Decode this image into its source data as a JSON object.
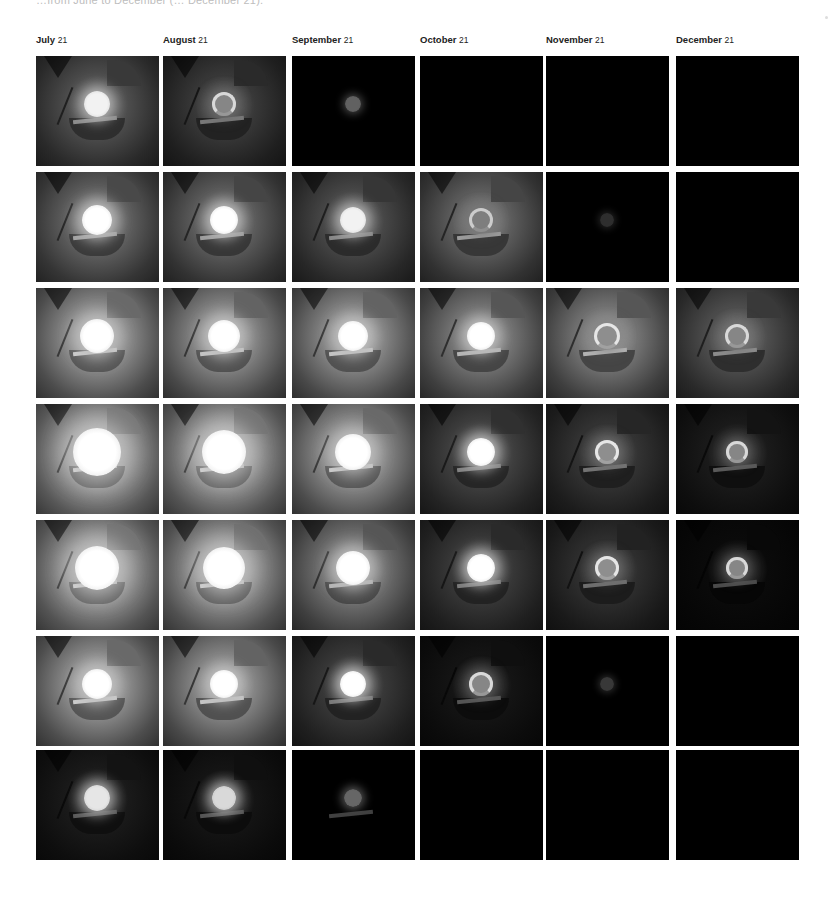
{
  "caption": "…from June to December (… December 21).",
  "columns": [
    {
      "month": "July",
      "day": "21"
    },
    {
      "month": "August",
      "day": "21"
    },
    {
      "month": "September",
      "day": "21"
    },
    {
      "month": "October",
      "day": "21"
    },
    {
      "month": "November",
      "day": "21"
    },
    {
      "month": "December",
      "day": "21"
    }
  ],
  "layout": {
    "col_x": [
      0,
      127,
      256,
      384,
      510,
      640
    ],
    "row_y": [
      0,
      116,
      232,
      348,
      464,
      580,
      694
    ],
    "cell_w": 123,
    "cell_h": 110
  },
  "rows": [
    {
      "cells": [
        {
          "bg": 0.3,
          "light": 0.95,
          "size": 26,
          "structure": 0.45,
          "ring": false
        },
        {
          "bg": 0.22,
          "light": 0.85,
          "size": 24,
          "structure": 0.4,
          "ring": true
        },
        {
          "bg": 0.0,
          "light": 0.38,
          "size": 16,
          "structure": 0.0,
          "ring": false
        },
        {
          "bg": 0.0,
          "light": 0.0,
          "size": 0,
          "structure": 0.0,
          "ring": false
        },
        {
          "bg": 0.0,
          "light": 0.0,
          "size": 0,
          "structure": 0.0,
          "ring": false
        },
        {
          "bg": 0.0,
          "light": 0.0,
          "size": 0,
          "structure": 0.0,
          "ring": false
        }
      ]
    },
    {
      "cells": [
        {
          "bg": 0.38,
          "light": 1.0,
          "size": 30,
          "structure": 0.55,
          "ring": false
        },
        {
          "bg": 0.36,
          "light": 1.0,
          "size": 28,
          "structure": 0.55,
          "ring": false
        },
        {
          "bg": 0.28,
          "light": 0.95,
          "size": 26,
          "structure": 0.45,
          "ring": false
        },
        {
          "bg": 0.36,
          "light": 0.8,
          "size": 24,
          "structure": 0.55,
          "ring": true
        },
        {
          "bg": 0.0,
          "light": 0.18,
          "size": 14,
          "structure": 0.0,
          "ring": false
        },
        {
          "bg": 0.0,
          "light": 0.0,
          "size": 0,
          "structure": 0.0,
          "ring": false
        }
      ]
    },
    {
      "cells": [
        {
          "bg": 0.55,
          "light": 1.0,
          "size": 34,
          "structure": 0.7,
          "ring": false
        },
        {
          "bg": 0.52,
          "light": 1.0,
          "size": 32,
          "structure": 0.7,
          "ring": false
        },
        {
          "bg": 0.52,
          "light": 1.0,
          "size": 30,
          "structure": 0.7,
          "ring": false
        },
        {
          "bg": 0.45,
          "light": 1.0,
          "size": 28,
          "structure": 0.65,
          "ring": false
        },
        {
          "bg": 0.45,
          "light": 0.9,
          "size": 26,
          "structure": 0.65,
          "ring": true
        },
        {
          "bg": 0.3,
          "light": 0.85,
          "size": 24,
          "structure": 0.5,
          "ring": true
        }
      ]
    },
    {
      "cells": [
        {
          "bg": 0.62,
          "light": 1.0,
          "size": 48,
          "structure": 0.8,
          "ring": false
        },
        {
          "bg": 0.6,
          "light": 1.0,
          "size": 44,
          "structure": 0.8,
          "ring": false
        },
        {
          "bg": 0.55,
          "light": 1.0,
          "size": 36,
          "structure": 0.75,
          "ring": false
        },
        {
          "bg": 0.25,
          "light": 1.0,
          "size": 28,
          "structure": 0.45,
          "ring": false
        },
        {
          "bg": 0.2,
          "light": 0.9,
          "size": 24,
          "structure": 0.4,
          "ring": true
        },
        {
          "bg": 0.1,
          "light": 0.85,
          "size": 22,
          "structure": 0.35,
          "ring": true
        }
      ]
    },
    {
      "cells": [
        {
          "bg": 0.6,
          "light": 1.0,
          "size": 44,
          "structure": 0.8,
          "ring": false
        },
        {
          "bg": 0.58,
          "light": 1.0,
          "size": 42,
          "structure": 0.8,
          "ring": false
        },
        {
          "bg": 0.45,
          "light": 1.0,
          "size": 34,
          "structure": 0.7,
          "ring": false
        },
        {
          "bg": 0.22,
          "light": 1.0,
          "size": 28,
          "structure": 0.45,
          "ring": false
        },
        {
          "bg": 0.18,
          "light": 0.9,
          "size": 24,
          "structure": 0.4,
          "ring": true
        },
        {
          "bg": 0.04,
          "light": 0.85,
          "size": 22,
          "structure": 0.25,
          "ring": true
        }
      ]
    },
    {
      "cells": [
        {
          "bg": 0.55,
          "light": 1.0,
          "size": 30,
          "structure": 0.75,
          "ring": false
        },
        {
          "bg": 0.52,
          "light": 1.0,
          "size": 28,
          "structure": 0.75,
          "ring": false
        },
        {
          "bg": 0.22,
          "light": 1.0,
          "size": 26,
          "structure": 0.45,
          "ring": false
        },
        {
          "bg": 0.08,
          "light": 0.85,
          "size": 24,
          "structure": 0.3,
          "ring": true
        },
        {
          "bg": 0.0,
          "light": 0.22,
          "size": 14,
          "structure": 0.0,
          "ring": false
        },
        {
          "bg": 0.0,
          "light": 0.0,
          "size": 0,
          "structure": 0.0,
          "ring": false
        }
      ]
    },
    {
      "cells": [
        {
          "bg": 0.1,
          "light": 0.9,
          "size": 26,
          "structure": 0.3,
          "ring": false
        },
        {
          "bg": 0.08,
          "light": 0.85,
          "size": 24,
          "structure": 0.28,
          "ring": false
        },
        {
          "bg": 0.0,
          "light": 0.4,
          "size": 18,
          "structure": 0.05,
          "ring": false
        },
        {
          "bg": 0.0,
          "light": 0.0,
          "size": 0,
          "structure": 0.0,
          "ring": false
        },
        {
          "bg": 0.0,
          "light": 0.0,
          "size": 0,
          "structure": 0.0,
          "ring": false
        },
        {
          "bg": 0.0,
          "light": 0.0,
          "size": 0,
          "structure": 0.0,
          "ring": false
        }
      ]
    }
  ]
}
